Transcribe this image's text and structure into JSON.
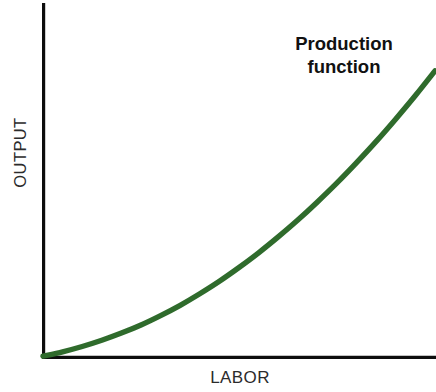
{
  "figure": {
    "background_color": "#ffffff",
    "width": 436,
    "height": 392
  },
  "axes": {
    "x_label": "LABOR",
    "y_label": "OUTPUT",
    "axis_color": "#0d0d0d",
    "origin_px": [
      42,
      357
    ]
  },
  "annotation": {
    "line1": "Production",
    "line2": "function",
    "color": "#111111"
  },
  "chart_data": {
    "type": "line",
    "title": "",
    "subtitle": "",
    "xlabel": "LABOR",
    "ylabel": "OUTPUT",
    "xlim": [
      0,
      100
    ],
    "ylim": [
      0,
      100
    ],
    "grid": false,
    "legend_position": "inline-annotation",
    "x_ticks": [],
    "y_ticks": [],
    "annotations": [
      {
        "text": "Production function",
        "position": "top-right",
        "bold": true,
        "color": "#111111"
      }
    ],
    "series": [
      {
        "name": "Production function",
        "color": "#2f6b2c",
        "line_width": 5.4,
        "shape": "increasing-convex",
        "x": [
          0,
          5,
          10,
          15,
          20,
          25,
          30,
          35,
          40,
          45,
          50,
          55,
          60,
          65,
          70,
          75,
          80,
          85,
          90,
          95,
          100
        ],
        "y": [
          0,
          1.4,
          3.1,
          5.1,
          7.4,
          10.0,
          13.0,
          16.3,
          20.0,
          24.0,
          28.4,
          33.1,
          38.2,
          43.6,
          49.4,
          55.5,
          62.0,
          68.8,
          76.0,
          83.5,
          91.4
        ]
      }
    ]
  }
}
